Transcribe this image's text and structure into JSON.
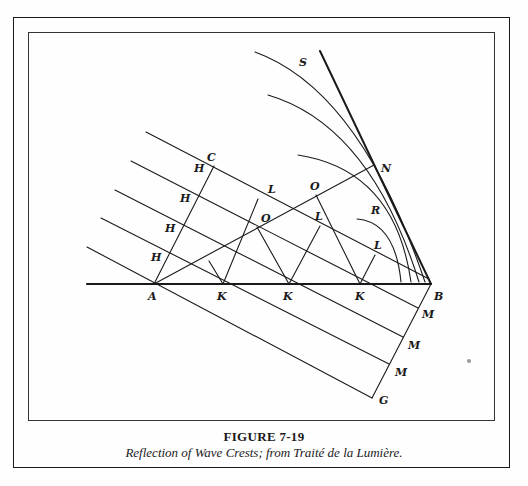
{
  "figure": {
    "title": "FIGURE 7-19",
    "caption": "Reflection of Wave Crests; from Traité de la Lumière."
  },
  "labels": {
    "S": "S",
    "C": "C",
    "N": "N",
    "R": "R",
    "A": "A",
    "B": "B",
    "G": "G",
    "H": [
      "H",
      "H",
      "H",
      "H"
    ],
    "K": [
      "K",
      "K",
      "K"
    ],
    "L": [
      "L",
      "L",
      "L"
    ],
    "O": [
      "O",
      "O"
    ],
    "M": [
      "M",
      "M",
      "M"
    ]
  },
  "colors": {
    "ink": "#1a1a1a",
    "paper": "#fefefe"
  }
}
